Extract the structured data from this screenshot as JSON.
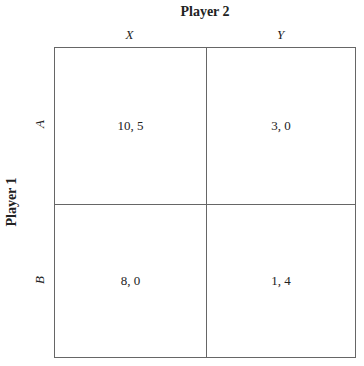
{
  "player_column": "Player 2",
  "player_row": "Player 1",
  "columns": [
    "X",
    "Y"
  ],
  "rows": [
    "A",
    "B"
  ],
  "payoffs": [
    [
      "10, 5",
      "3, 0"
    ],
    [
      "8, 0",
      "1, 4"
    ]
  ],
  "colors": {
    "line": "#666666",
    "text": "#222222",
    "background": "#ffffff"
  }
}
